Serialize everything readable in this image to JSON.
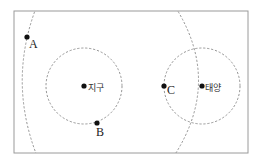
{
  "diagram": {
    "colors": {
      "frame": "#9a9a9a",
      "dashed": "#8a8a8a",
      "point": "#111111"
    },
    "frame": {
      "x": 14,
      "y": 11,
      "width": 234,
      "height": 142
    },
    "circles": [
      {
        "name": "earth-orbit-circle",
        "cx": 84,
        "cy": 86,
        "r": 38
      },
      {
        "name": "sun-circle",
        "cx": 202,
        "cy": 86,
        "r": 38
      }
    ],
    "points": [
      {
        "id": "A",
        "label": "A",
        "x": 27,
        "y": 37
      },
      {
        "id": "earth",
        "label": "지구",
        "x": 84,
        "y": 86
      },
      {
        "id": "B",
        "label": "B",
        "x": 97,
        "y": 123
      },
      {
        "id": "C",
        "label": "C",
        "x": 164,
        "y": 86
      },
      {
        "id": "sun",
        "label": "태양",
        "x": 202,
        "y": 86
      }
    ],
    "labels": {
      "A": "A",
      "B": "B",
      "C": "C",
      "earth": "지구",
      "sun": "태양"
    }
  }
}
